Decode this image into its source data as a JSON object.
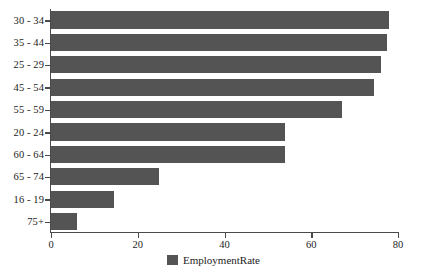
{
  "chart_data": {
    "type": "bar",
    "orientation": "horizontal",
    "title": "",
    "xlabel": "",
    "ylabel": "",
    "categories": [
      "30 - 34",
      "35 - 44",
      "25 - 29",
      "45 - 54",
      "55 - 59",
      "20 - 24",
      "60 - 64",
      "65 - 74",
      "16 - 19",
      "75+"
    ],
    "values": [
      78,
      77.5,
      76,
      74.5,
      67,
      54,
      54,
      25,
      14.5,
      6
    ],
    "series": [
      {
        "name": "EmploymentRate",
        "values": [
          78,
          77.5,
          76,
          74.5,
          67,
          54,
          54,
          25,
          14.5,
          6
        ]
      }
    ],
    "xlim": [
      0,
      80
    ],
    "xticks": [
      0,
      20,
      40,
      60,
      80
    ],
    "xtick_labels": [
      "0",
      "20",
      "40",
      "60",
      "80"
    ],
    "grid": false,
    "legend": {
      "position": "bottom-center",
      "entries": [
        {
          "label": "EmploymentRate",
          "color": "#545454"
        }
      ]
    },
    "colors": {
      "bar": "#545454",
      "axis": "#4a4a4a",
      "text": "#1c1c1c",
      "background": "#ffffff"
    }
  }
}
